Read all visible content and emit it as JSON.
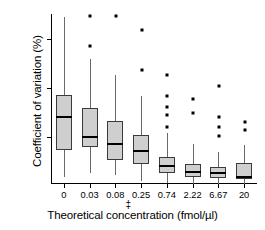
{
  "chart_data": {
    "type": "box",
    "title": "",
    "xlabel": "Theoretical concentration (fmol/µl)",
    "ylabel": "Coefficient of variation (%)",
    "xlabel_footnote_symbol": "‡",
    "categories": [
      "0",
      "0.03",
      "0.08",
      "0.25",
      "0.74",
      "2.22",
      "6.67",
      "20"
    ],
    "yticks": [
      50,
      100,
      150
    ],
    "ytick_labels": [
      "50",
      "100",
      "150"
    ],
    "ylim": [
      0,
      180
    ],
    "grid": false,
    "legend": null,
    "box_fill_color": "#cfcfcf",
    "box_edge_color": "#3a3a3a",
    "median_color": "#000000",
    "outlier_color": "#000000",
    "boxes": [
      {
        "category": "0",
        "whisker_low": 9,
        "q1": 37,
        "median": 70,
        "q3": 93,
        "whisker_high": 172,
        "outliers": []
      },
      {
        "category": "0.03",
        "whisker_low": 13,
        "q1": 40,
        "median": 50,
        "q3": 80,
        "whisker_high": 130,
        "outliers": [
          143,
          173
        ]
      },
      {
        "category": "0.08",
        "whisker_low": 11,
        "q1": 27,
        "median": 43,
        "q3": 66,
        "whisker_high": 113,
        "outliers": [
          173
        ]
      },
      {
        "category": "0.25",
        "whisker_low": 5,
        "q1": 22,
        "median": 36,
        "q3": 52,
        "whisker_high": 92,
        "outliers": [
          118,
          159
        ]
      },
      {
        "category": "0.74",
        "whisker_low": 3,
        "q1": 13,
        "median": 20,
        "q3": 30,
        "whisker_high": 54,
        "outliers": [
          60,
          72,
          81,
          92,
          113
        ]
      },
      {
        "category": "2.22",
        "whisker_low": 2,
        "q1": 9,
        "median": 14,
        "q3": 22,
        "whisker_high": 43,
        "outliers": [
          74,
          89
        ]
      },
      {
        "category": "6.67",
        "whisker_low": 2,
        "q1": 8,
        "median": 13,
        "q3": 19,
        "whisker_high": 35,
        "outliers": [
          51,
          60,
          70,
          102
        ]
      },
      {
        "category": "20",
        "whisker_low": 2,
        "q1": 7,
        "median": 9,
        "q3": 23,
        "whisker_high": 42,
        "outliers": [
          57,
          65
        ]
      }
    ]
  }
}
